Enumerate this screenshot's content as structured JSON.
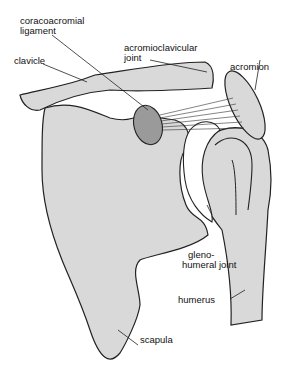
{
  "diagram": {
    "colors": {
      "bone": "#d9d9d9",
      "outline": "#222222",
      "coracoid": "#9a9a9a",
      "background": "#ffffff"
    },
    "labels": {
      "coracoacromial_ligament": {
        "line1": "coracoacromial",
        "line2": "ligament"
      },
      "clavicle": "clavicle",
      "acromioclavicular_joint": {
        "line1": "acromioclavicular",
        "line2": "joint"
      },
      "acromion": "acromion",
      "glenohumeral_joint": {
        "line1": "gleno-",
        "line2": "humeral joint"
      },
      "humerus": "humerus",
      "scapula": "scapula"
    }
  }
}
